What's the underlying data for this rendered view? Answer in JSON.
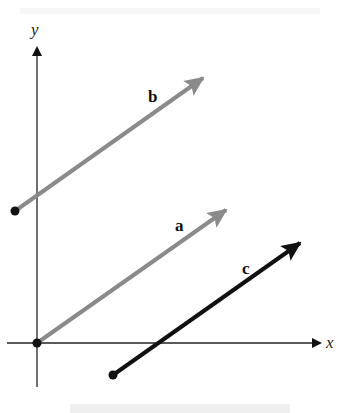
{
  "diagram": {
    "type": "vector-diagram",
    "axes": {
      "x_label": "x",
      "y_label": "y",
      "origin": [
        37,
        343
      ]
    },
    "vectors": [
      {
        "name": "a",
        "label": "a",
        "start": [
          37,
          343
        ],
        "end": [
          226,
          210
        ],
        "color": "#8a8a8a",
        "label_pos": [
          180,
          230
        ]
      },
      {
        "name": "b",
        "label": "b",
        "start": [
          15,
          211
        ],
        "end": [
          203,
          78
        ],
        "color": "#8a8a8a",
        "label_pos": [
          153,
          101
        ]
      },
      {
        "name": "c",
        "label": "c",
        "start": [
          113,
          375
        ],
        "end": [
          300,
          243
        ],
        "color": "#111111",
        "label_pos": [
          246,
          273
        ]
      }
    ]
  }
}
